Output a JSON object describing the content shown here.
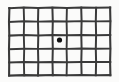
{
  "figure": {
    "caption": "",
    "background_color": "#fbfbfa",
    "line_color": "#3a3a3a",
    "line_color_light": "#555555",
    "fixation_dot_color": "#111111"
  },
  "chart_data": {
    "type": "table",
    "xlabel": "",
    "ylabel": "",
    "columns": 7,
    "rows": 5,
    "grid": true,
    "legend": "none",
    "vertical_line_x": [
      9,
      23.8,
      38.1,
      52.4,
      66.8,
      81.3,
      95.9,
      110.2
    ],
    "horizontal_line_y": [
      7.8,
      21.4,
      35.3,
      48.8,
      62.1,
      75.2
    ],
    "xlim": [
      9,
      110
    ],
    "ylim": [
      8,
      75
    ],
    "annotations": [
      {
        "label": "fixation-dot",
        "x": 59.5,
        "y": 40.0,
        "radius": 2.6,
        "color": "#111111"
      }
    ]
  },
  "labels": {
    "figure_alt": "Hand-drawn grid of seven columns by five rows with a filled dot at the center"
  }
}
